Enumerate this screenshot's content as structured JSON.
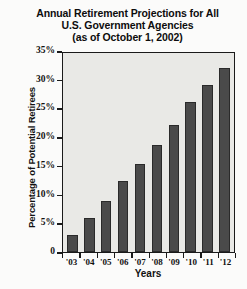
{
  "chart_data": {
    "type": "bar",
    "title": "Annual Retirement Projections for All U.S. Government Agencies (as of October 1, 2002)",
    "title_lines": [
      "Annual Retirement Projections for All",
      "U.S. Government Agencies",
      "(as of October 1, 2002)"
    ],
    "categories": [
      "'03",
      "'04",
      "'05",
      "'06",
      "'07",
      "'08",
      "'09",
      "'10",
      "'11",
      "'12"
    ],
    "values": [
      3,
      6,
      9,
      12.5,
      15.5,
      19,
      22.5,
      26.5,
      29.5,
      32.5
    ],
    "xlabel": "Years",
    "ylabel": "Percentage of Potential Retirees",
    "ylim": [
      0,
      35
    ],
    "ytick_labels": [
      "35%",
      "30%",
      "25%",
      "20%",
      "15%",
      "10%",
      "5%",
      "0"
    ],
    "ytick_values": [
      35,
      30,
      25,
      20,
      15,
      10,
      5,
      0
    ],
    "grid": false,
    "legend": null,
    "colors": {
      "bar_fill": "#4a4a4a",
      "bar_stroke": "#2a2a2a",
      "plot_background": "#e9e9e6",
      "axis": "#1a1a1a",
      "page_background": "#fbfbfa",
      "text": "#111111"
    }
  }
}
